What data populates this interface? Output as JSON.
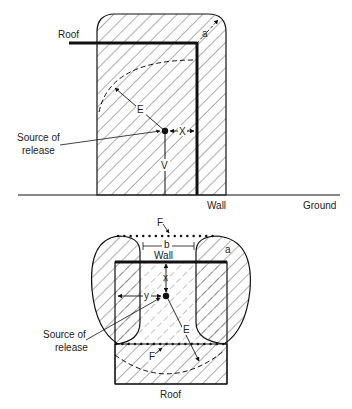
{
  "top_view": {
    "roof_label": "Roof",
    "wall_label": "Wall",
    "ground_label": "Ground",
    "source_label_line1": "Source of",
    "source_label_line2": "release",
    "dim_a": "a",
    "dim_e": "E",
    "dim_x": "X",
    "dim_v": "V"
  },
  "bottom_view": {
    "wall_label": "Wall",
    "roof_label": "Roof",
    "source_label_line1": "Source of",
    "source_label_line2": "release",
    "dim_a": "a",
    "dim_b": "b",
    "dim_e": "E",
    "dim_x": "x",
    "dim_y": "y",
    "dim_f_top": "F",
    "dim_f_bottom": "F"
  },
  "colors": {
    "line": "#111111",
    "hatch": "#333333",
    "background": "#ffffff"
  }
}
